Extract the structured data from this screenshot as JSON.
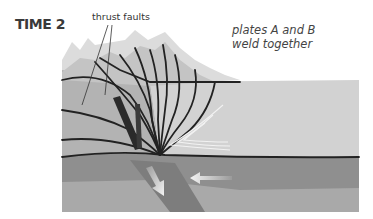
{
  "title": "TIME 2",
  "annotations": {
    "thrust_faults": "thrust faults",
    "weld_line1": "plates A and B",
    "weld_line2": "weld together"
  },
  "colors": {
    "background": "#ffffff",
    "sky_peaks_light": "#dcdcdc",
    "peak_mid": "#c4c4c4",
    "crust_left": "#b3b3b3",
    "crust_right": "#d2d2d2",
    "fold_zone": "#c8c8c8",
    "lithosphere": "#8f8f8f",
    "mantle": "#a9a9a9",
    "slab": "#7d7d7d",
    "fault_line": "#222222",
    "fold_lines": "#f2f2f2",
    "arrow": "#f0f0f0"
  }
}
